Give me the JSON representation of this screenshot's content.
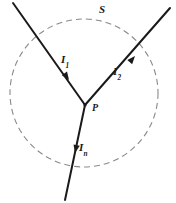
{
  "figure": {
    "background_color": "#ffffff",
    "width": 176,
    "height": 203,
    "labels": {
      "surface": "S",
      "junction": "P",
      "current_1": "I",
      "current_1_sub": "1",
      "current_2": "I",
      "current_2_sub": "2",
      "current_n": "I",
      "current_n_sub": "n"
    },
    "colors": {
      "line": "#1a1a1a",
      "dashed_circle": "#8a8a8a",
      "label": "#1a1a1a"
    },
    "surface": {
      "shape": "circle",
      "style": "dashed",
      "center_x": 84,
      "center_y": 93,
      "radius": 74,
      "dash_pattern": "6 4"
    },
    "junction_point": {
      "x": 85,
      "y": 105
    },
    "branches": [
      {
        "name": "current-1",
        "label": "I1",
        "direction": "into-junction",
        "from_x": 13,
        "from_y": 3,
        "to_x": 85,
        "to_y": 105,
        "arrow_x": 68,
        "arrow_y": 79,
        "arrow_angle_deg": 55
      },
      {
        "name": "current-2",
        "label": "I2",
        "direction": "out-of-junction",
        "from_x": 85,
        "from_y": 105,
        "to_x": 170,
        "to_y": 8,
        "arrow_x": 133,
        "arrow_y": 57,
        "arrow_angle_deg": -49
      },
      {
        "name": "current-n",
        "label": "In",
        "direction": "out-of-junction",
        "from_x": 85,
        "from_y": 105,
        "to_x": 65,
        "to_y": 200,
        "arrow_x": 74,
        "arrow_y": 155,
        "arrow_angle_deg": 102
      }
    ]
  }
}
